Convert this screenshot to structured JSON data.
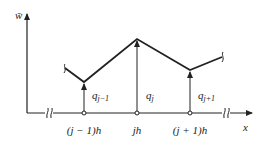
{
  "diagram": {
    "y_axis_label": "w̄",
    "x_axis_label": "x",
    "nodes": [
      {
        "label": "(j − 1)h",
        "value_label": "q",
        "value_sub": "j−1"
      },
      {
        "label": "jh",
        "value_label": "q",
        "value_sub": "j"
      },
      {
        "label": "(j + 1)h",
        "value_label": "q",
        "value_sub": "j+1"
      }
    ],
    "break_symbol": "∫∫",
    "colors": {
      "line": "#222222",
      "background": "#ffffff"
    }
  }
}
